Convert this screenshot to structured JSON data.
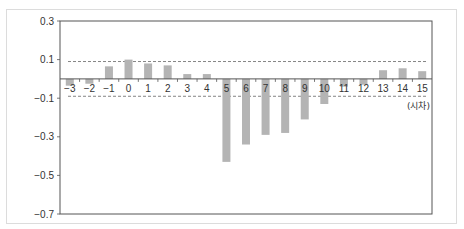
{
  "chart_data": {
    "type": "bar",
    "title": "",
    "xlabel": "(시차)",
    "ylabel": "",
    "categories": [
      "-3",
      "-2",
      "-1",
      "0",
      "1",
      "2",
      "3",
      "4",
      "5",
      "6",
      "7",
      "8",
      "9",
      "10",
      "11",
      "12",
      "13",
      "14",
      "15"
    ],
    "values": [
      -0.035,
      -0.025,
      0.065,
      0.1,
      0.08,
      0.07,
      0.025,
      0.025,
      -0.43,
      -0.34,
      -0.29,
      -0.28,
      -0.21,
      -0.13,
      -0.04,
      -0.03,
      0.045,
      0.055,
      0.04
    ],
    "ylim": [
      -0.7,
      0.3
    ],
    "yticks": [
      "0.3",
      "0.1",
      "-0.1",
      "-0.3",
      "-0.5",
      "-0.7"
    ],
    "ytick_values": [
      0.3,
      0.1,
      -0.1,
      -0.3,
      -0.5,
      -0.7
    ],
    "reference_lines": [
      0.09,
      -0.09
    ],
    "grid": false,
    "legend": null,
    "bar_color": "#b4b4b4",
    "axis_color": "#555555",
    "ref_line_color": "#666666"
  }
}
